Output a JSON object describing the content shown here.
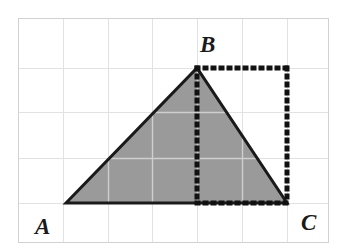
{
  "figure": {
    "type": "geometry-diagram",
    "canvas": {
      "width": 346,
      "height": 249,
      "background": "#ffffff"
    },
    "grid": {
      "stroke": "#e2e2e2",
      "stroke_width": 1,
      "left": 18,
      "top": 18,
      "right": 328,
      "bottom": 242,
      "vertical_lines": [
        18,
        63,
        108,
        152,
        197,
        242,
        287,
        328
      ],
      "horizontal_lines": [
        18,
        68,
        112,
        158,
        203,
        242
      ],
      "cell_width": 45,
      "cell_height": 45
    },
    "triangle": {
      "name": "ABC",
      "fill": "#9a9a9a",
      "stroke": "#1a1a1a",
      "stroke_width": 3,
      "points": "66,203 197,68 287,203",
      "vertices": [
        {
          "label": "A",
          "x": 66,
          "y": 203
        },
        {
          "label": "B",
          "x": 197,
          "y": 68
        },
        {
          "label": "C",
          "x": 287,
          "y": 203
        }
      ]
    },
    "dotted": {
      "color": "#111111",
      "stroke_width": 5,
      "dash": "1 7",
      "segments": [
        {
          "name": "top-edge",
          "x1": 197,
          "y1": 68,
          "x2": 287,
          "y2": 68
        },
        {
          "name": "right-edge",
          "x1": 287,
          "y1": 68,
          "x2": 287,
          "y2": 203
        },
        {
          "name": "altitude",
          "x1": 197,
          "y1": 68,
          "x2": 197,
          "y2": 203
        },
        {
          "name": "base-segment",
          "x1": 197,
          "y1": 203,
          "x2": 287,
          "y2": 203
        }
      ]
    },
    "labels": {
      "a": "A",
      "b": "B",
      "c": "C"
    }
  }
}
